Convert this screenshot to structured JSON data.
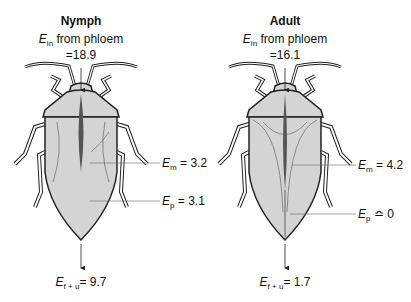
{
  "panels": [
    {
      "title": "Nymph",
      "input": {
        "symbol": "E",
        "subscript": "in",
        "text": "from phloem",
        "value": "=18.9"
      },
      "labels": [
        {
          "symbol": "E",
          "subscript": "m",
          "relation": "=",
          "value": "3.2"
        },
        {
          "symbol": "E",
          "subscript": "p",
          "relation": "=",
          "value": "3.1"
        }
      ],
      "output": {
        "symbol": "E",
        "subscript": "f + u",
        "relation": "=",
        "value": "9.7"
      }
    },
    {
      "title": "Adult",
      "input": {
        "symbol": "E",
        "subscript": "in",
        "text": "from phloem",
        "value": "=16.1"
      },
      "labels": [
        {
          "symbol": "E",
          "subscript": "m",
          "relation": "=",
          "value": "4.2"
        },
        {
          "symbol": "E",
          "subscript": "p",
          "relation": "≏",
          "value": "0"
        }
      ],
      "output": {
        "symbol": "E",
        "subscript": "f + u",
        "relation": "=",
        "value": "1.7"
      }
    }
  ],
  "colors": {
    "body_fill": "#d4d4d4",
    "outline": "#222222",
    "gut": "#555555"
  }
}
